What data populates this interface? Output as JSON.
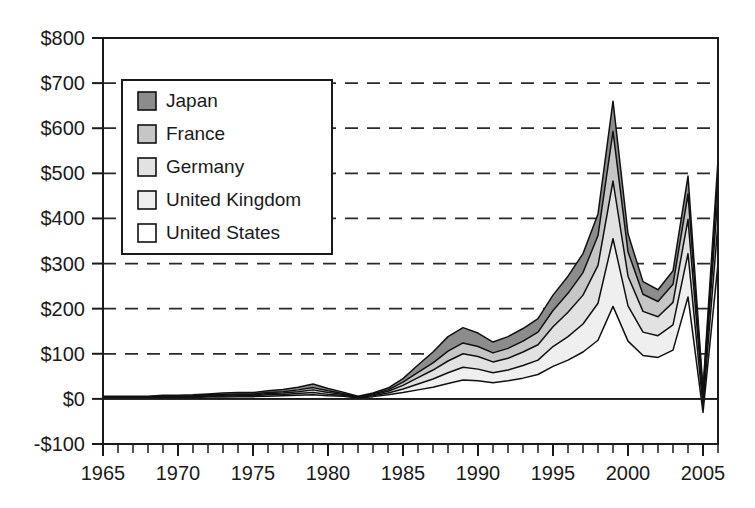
{
  "chart_data": {
    "type": "area",
    "stacked": true,
    "title": "",
    "subtitle": "",
    "xlabel": "",
    "ylabel": "",
    "xlim": [
      1965,
      2006
    ],
    "ylim": [
      -100,
      800
    ],
    "ytick_step": 100,
    "xtick_step": 1,
    "xtick_label_step": 5,
    "grid": "horizontal-dashed",
    "legend_position": "upper-left-inside",
    "value_prefix": "$",
    "ytick_labels": [
      "$800",
      "$700",
      "$600",
      "$500",
      "$400",
      "$300",
      "$200",
      "$100",
      "$0",
      "-$100"
    ],
    "ytick_values": [
      800,
      700,
      600,
      500,
      400,
      300,
      200,
      100,
      0,
      -100
    ],
    "xtick_labels": [
      "1965",
      "1970",
      "1975",
      "1980",
      "1985",
      "1990",
      "1995",
      "2000",
      "2005"
    ],
    "xtick_values": [
      1965,
      1970,
      1975,
      1980,
      1985,
      1990,
      1995,
      2000,
      2005
    ],
    "x": [
      1965,
      1966,
      1967,
      1968,
      1969,
      1970,
      1971,
      1972,
      1973,
      1974,
      1975,
      1976,
      1977,
      1978,
      1979,
      1980,
      1981,
      1982,
      1983,
      1984,
      1985,
      1986,
      1987,
      1988,
      1989,
      1990,
      1991,
      1992,
      1993,
      1994,
      1995,
      1996,
      1997,
      1998,
      1999,
      2000,
      2001,
      2002,
      2003,
      2004,
      2005,
      2006
    ],
    "series": [
      {
        "name": "United States",
        "fill": "#ffffff",
        "order": 1,
        "values": [
          2,
          2,
          2,
          2,
          3,
          3,
          3,
          4,
          4,
          5,
          5,
          6,
          7,
          8,
          9,
          7,
          6,
          2,
          5,
          9,
          14,
          20,
          26,
          34,
          42,
          40,
          36,
          40,
          46,
          54,
          72,
          86,
          104,
          130,
          205,
          128,
          96,
          92,
          108,
          226,
          -30,
          300
        ]
      },
      {
        "name": "United Kingdom",
        "fill": "#efefef",
        "order": 2,
        "values": [
          1,
          1,
          1,
          1,
          1,
          1,
          2,
          2,
          2,
          2,
          2,
          3,
          3,
          4,
          5,
          3,
          2,
          1,
          2,
          4,
          8,
          13,
          18,
          24,
          28,
          26,
          22,
          24,
          28,
          32,
          44,
          52,
          62,
          82,
          150,
          78,
          52,
          48,
          56,
          96,
          14,
          90
        ]
      },
      {
        "name": "Germany",
        "fill": "#e2e2e2",
        "order": 3,
        "values": [
          1,
          1,
          1,
          1,
          1,
          1,
          1,
          2,
          2,
          2,
          2,
          3,
          3,
          4,
          6,
          4,
          2,
          1,
          2,
          4,
          8,
          14,
          20,
          26,
          30,
          28,
          24,
          26,
          30,
          34,
          44,
          54,
          64,
          84,
          128,
          66,
          46,
          42,
          50,
          76,
          16,
          64
        ]
      },
      {
        "name": "France",
        "fill": "#c6c6c6",
        "order": 4,
        "values": [
          1,
          1,
          1,
          1,
          1,
          1,
          1,
          1,
          2,
          2,
          2,
          2,
          3,
          4,
          5,
          4,
          2,
          1,
          2,
          3,
          7,
          12,
          16,
          22,
          24,
          22,
          20,
          22,
          24,
          28,
          36,
          42,
          50,
          66,
          110,
          54,
          38,
          34,
          40,
          56,
          12,
          44
        ]
      },
      {
        "name": "Japan",
        "fill": "#8c8c8c",
        "order": 5,
        "values": [
          1,
          1,
          1,
          1,
          2,
          2,
          2,
          2,
          3,
          3,
          3,
          4,
          5,
          6,
          8,
          5,
          3,
          1,
          2,
          4,
          8,
          16,
          24,
          32,
          34,
          30,
          24,
          26,
          28,
          30,
          34,
          38,
          42,
          48,
          67,
          40,
          28,
          26,
          30,
          40,
          10,
          32
        ]
      }
    ]
  },
  "legend": {
    "entries": [
      {
        "label": "Japan",
        "swatch": "#8c8c8c"
      },
      {
        "label": "France",
        "swatch": "#c6c6c6"
      },
      {
        "label": "Germany",
        "swatch": "#e2e2e2"
      },
      {
        "label": "United Kingdom",
        "swatch": "#efefef"
      },
      {
        "label": "United States",
        "swatch": "#ffffff"
      }
    ]
  },
  "colors": {
    "axis": "#1a1a1a",
    "grid": "#2a2a2a",
    "background": "#ffffff",
    "series_outline": "#111111"
  }
}
